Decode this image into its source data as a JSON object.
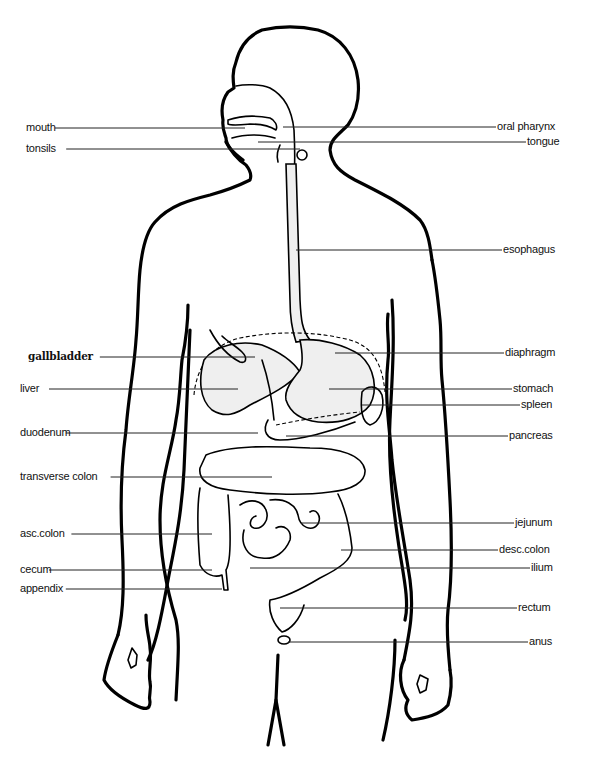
{
  "diagram": {
    "labels_left": [
      {
        "id": "mouth",
        "text": "mouth",
        "x": 26,
        "y": 128,
        "tx": 245
      },
      {
        "id": "tonsils",
        "text": "tonsils",
        "x": 26,
        "y": 149,
        "tx": 300
      },
      {
        "id": "gallbladder",
        "text": "gallbladder",
        "x": 28,
        "y": 357,
        "tx": 255,
        "serif": true
      },
      {
        "id": "liver",
        "text": "liver",
        "x": 20,
        "y": 389,
        "tx": 238
      },
      {
        "id": "duodenum",
        "text": "duodenum",
        "x": 20,
        "y": 433,
        "tx": 258
      },
      {
        "id": "transverse-colon",
        "text": "transverse colon",
        "x": 20,
        "y": 477,
        "tx": 272
      },
      {
        "id": "asc-colon",
        "text": "asc.colon",
        "x": 20,
        "y": 534,
        "tx": 212
      },
      {
        "id": "cecum",
        "text": "cecum",
        "x": 20,
        "y": 570,
        "tx": 212
      },
      {
        "id": "appendix",
        "text": "appendix",
        "x": 20,
        "y": 589,
        "tx": 222
      }
    ],
    "labels_right": [
      {
        "id": "oral-pharynx",
        "text": "oral pharynx",
        "x": 497,
        "y": 127,
        "tx": 283
      },
      {
        "id": "tongue",
        "text": "tongue",
        "x": 527,
        "y": 142,
        "tx": 258
      },
      {
        "id": "esophagus",
        "text": "esophagus",
        "x": 503,
        "y": 250,
        "tx": 296
      },
      {
        "id": "diaphragm",
        "text": "diaphragm",
        "x": 505,
        "y": 353,
        "tx": 335
      },
      {
        "id": "stomach",
        "text": "stomach",
        "x": 513,
        "y": 389,
        "tx": 329
      },
      {
        "id": "spleen",
        "text": "spleen",
        "x": 521,
        "y": 405,
        "tx": 362
      },
      {
        "id": "pancreas",
        "text": "pancreas",
        "x": 509,
        "y": 436,
        "tx": 286
      },
      {
        "id": "jejunum",
        "text": "jejunum",
        "x": 515,
        "y": 523,
        "tx": 301
      },
      {
        "id": "desc-colon",
        "text": "desc.colon",
        "x": 499,
        "y": 550,
        "tx": 341
      },
      {
        "id": "ilium",
        "text": "ilium",
        "x": 531,
        "y": 568,
        "tx": 250
      },
      {
        "id": "rectum",
        "text": "rectum",
        "x": 518,
        "y": 608,
        "tx": 280
      },
      {
        "id": "anus",
        "text": "anus",
        "x": 529,
        "y": 642,
        "tx": 288
      }
    ]
  },
  "colors": {
    "ink": "#000000",
    "shade": "#efefef",
    "background": "#ffffff"
  }
}
